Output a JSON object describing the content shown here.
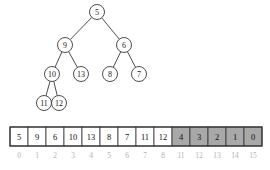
{
  "figure": {
    "caption": "",
    "colors": {
      "node_stroke": "#3a3a3a",
      "node_fill": "#ffffff",
      "edge": "#3a3a3a",
      "array_border": "#333333",
      "cell_fill": "#ffffff",
      "cell_fill_shaded": "#a8a8a8",
      "value_text": "#111111",
      "index_text": "#b3b3b3",
      "background": "#ffffff"
    }
  },
  "tree": {
    "type": "binary-tree",
    "nodes": [
      {
        "id": "n0",
        "label": "5",
        "cx": 97,
        "cy": 12,
        "r": 7.5
      },
      {
        "id": "n1",
        "label": "9",
        "cx": 65,
        "cy": 45,
        "r": 7.5
      },
      {
        "id": "n2",
        "label": "6",
        "cx": 124,
        "cy": 45,
        "r": 7.5
      },
      {
        "id": "n3",
        "label": "10",
        "cx": 52,
        "cy": 74,
        "r": 7.5
      },
      {
        "id": "n4",
        "label": "13",
        "cx": 81,
        "cy": 74,
        "r": 7.5
      },
      {
        "id": "n5",
        "label": "8",
        "cx": 110,
        "cy": 74,
        "r": 7.5
      },
      {
        "id": "n6",
        "label": "7",
        "cx": 139,
        "cy": 74,
        "r": 7.5
      },
      {
        "id": "n7",
        "label": "11",
        "cx": 44,
        "cy": 103,
        "r": 7.5
      },
      {
        "id": "n8",
        "label": "12",
        "cx": 59,
        "cy": 103,
        "r": 7.5
      }
    ],
    "edges": [
      {
        "from": "n0",
        "to": "n1"
      },
      {
        "from": "n0",
        "to": "n2"
      },
      {
        "from": "n1",
        "to": "n3"
      },
      {
        "from": "n1",
        "to": "n4"
      },
      {
        "from": "n2",
        "to": "n5"
      },
      {
        "from": "n2",
        "to": "n6"
      },
      {
        "from": "n3",
        "to": "n7"
      },
      {
        "from": "n3",
        "to": "n8"
      }
    ]
  },
  "array": {
    "x": 10,
    "y": 127,
    "width": 252,
    "height": 19,
    "cells": [
      {
        "value": "5",
        "index": "0",
        "shaded": false
      },
      {
        "value": "9",
        "index": "1",
        "shaded": false
      },
      {
        "value": "6",
        "index": "2",
        "shaded": false
      },
      {
        "value": "10",
        "index": "3",
        "shaded": false
      },
      {
        "value": "13",
        "index": "4",
        "shaded": false
      },
      {
        "value": "8",
        "index": "5",
        "shaded": false
      },
      {
        "value": "7",
        "index": "6",
        "shaded": false
      },
      {
        "value": "11",
        "index": "7",
        "shaded": false
      },
      {
        "value": "12",
        "index": "8",
        "shaded": false
      },
      {
        "value": "4",
        "index": "11",
        "shaded": true
      },
      {
        "value": "3",
        "index": "12",
        "shaded": true
      },
      {
        "value": "2",
        "index": "13",
        "shaded": true
      },
      {
        "value": "1",
        "index": "14",
        "shaded": true
      },
      {
        "value": "0",
        "index": "15",
        "shaded": true
      }
    ],
    "index_row_y": 156
  }
}
